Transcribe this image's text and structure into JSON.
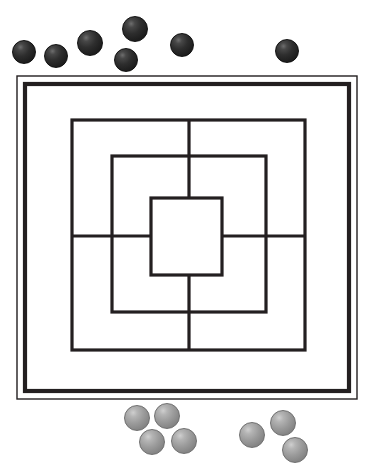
{
  "scene": {
    "title": "Nine Men's Morris board with captured stones",
    "width": 371,
    "height": 476,
    "background_color": "#ffffff"
  },
  "board": {
    "name": "nine-mens-morris-board",
    "line_color": "#231f20",
    "frame": {
      "outer_thin_rect": {
        "x": 17,
        "y": 76,
        "width": 340,
        "height": 323,
        "stroke_width": 1.4
      },
      "inner_thick_rect": {
        "x": 25,
        "y": 84,
        "width": 324,
        "height": 307,
        "stroke_width": 4.2
      }
    },
    "rings": [
      {
        "id": "outer-ring",
        "x": 72,
        "y": 120,
        "width": 233,
        "height": 230,
        "stroke_width": 3.2
      },
      {
        "id": "middle-ring",
        "x": 112,
        "y": 156,
        "width": 154,
        "height": 156,
        "stroke_width": 3.2
      },
      {
        "id": "inner-ring",
        "x": 151,
        "y": 198,
        "width": 71,
        "height": 77,
        "stroke_width": 3.2
      }
    ],
    "connectors": [
      {
        "id": "connector-top",
        "x1": 189,
        "y1": 120,
        "x2": 189,
        "y2": 198,
        "stroke_width": 3.2
      },
      {
        "id": "connector-bottom",
        "x1": 189,
        "y1": 275,
        "x2": 189,
        "y2": 350,
        "stroke_width": 3.2
      },
      {
        "id": "connector-left",
        "x1": 72,
        "y1": 236,
        "x2": 151,
        "y2": 236,
        "stroke_width": 3.2
      },
      {
        "id": "connector-right",
        "x1": 222,
        "y1": 236,
        "x2": 305,
        "y2": 236,
        "stroke_width": 3.2
      }
    ]
  },
  "pieces": {
    "dark": {
      "label": "dark-stone",
      "color": "#2a2a2a",
      "count": 7,
      "positions": [
        {
          "id": "dark-1",
          "cx": 24,
          "cy": 52,
          "r": 12
        },
        {
          "id": "dark-2",
          "cx": 56,
          "cy": 56,
          "r": 12
        },
        {
          "id": "dark-3",
          "cx": 90,
          "cy": 43,
          "r": 13
        },
        {
          "id": "dark-4",
          "cx": 135,
          "cy": 29,
          "r": 13
        },
        {
          "id": "dark-5",
          "cx": 126,
          "cy": 60,
          "r": 12
        },
        {
          "id": "dark-6",
          "cx": 182,
          "cy": 45,
          "r": 12
        },
        {
          "id": "dark-7",
          "cx": 287,
          "cy": 51,
          "r": 12
        }
      ]
    },
    "light": {
      "label": "light-stone",
      "color": "#9a9a9a",
      "count": 7,
      "positions": [
        {
          "id": "light-1",
          "cx": 137,
          "cy": 418,
          "r": 13
        },
        {
          "id": "light-2",
          "cx": 167,
          "cy": 416,
          "r": 13
        },
        {
          "id": "light-3",
          "cx": 152,
          "cy": 442,
          "r": 13
        },
        {
          "id": "light-4",
          "cx": 184,
          "cy": 441,
          "r": 13
        },
        {
          "id": "light-5",
          "cx": 252,
          "cy": 435,
          "r": 13
        },
        {
          "id": "light-6",
          "cx": 283,
          "cy": 423,
          "r": 13
        },
        {
          "id": "light-7",
          "cx": 295,
          "cy": 450,
          "r": 13
        }
      ]
    }
  }
}
